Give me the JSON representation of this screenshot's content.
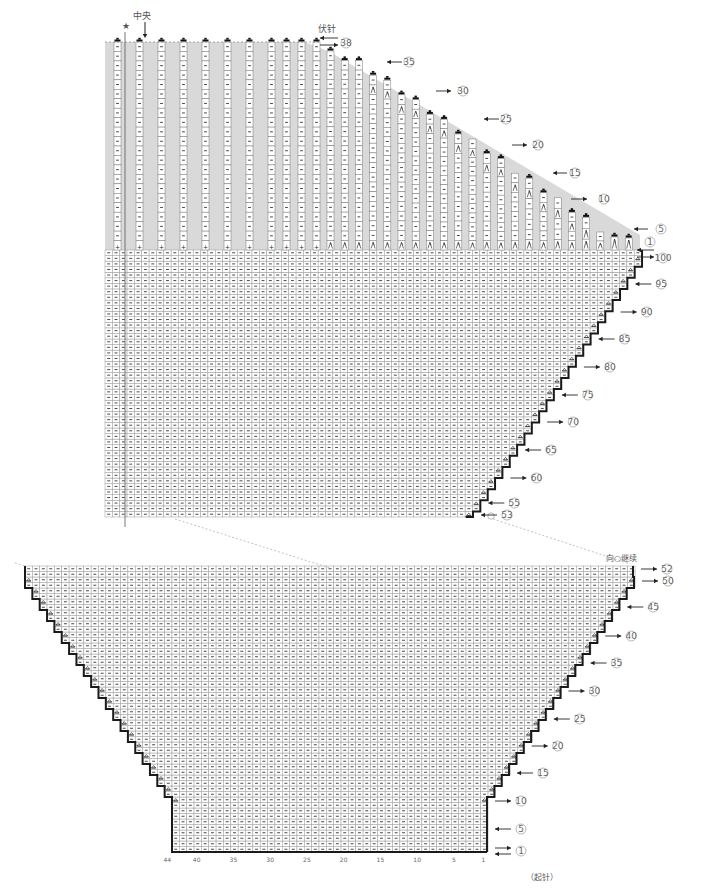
{
  "title_labels": {
    "center": "中央",
    "star": "★",
    "bind_off": "伏针",
    "continue_from": "向○继续",
    "cast_on": "（起针）"
  },
  "symbols": {
    "purl": "−",
    "decrease": "⋌",
    "increase": "⩓",
    "bind_off": "▬",
    "circle_marker": "○"
  },
  "colors": {
    "shade": "#d9d9d9",
    "grid": "#9a9a9a",
    "outline": "#1a1a1a",
    "text": "#555555"
  },
  "upper_chart": {
    "row_markers": [
      {
        "label": "①",
        "direction": "left"
      },
      {
        "label": "⑤",
        "direction": "left"
      },
      {
        "label": "⑩",
        "direction": "right"
      },
      {
        "label": "⑮",
        "direction": "left"
      },
      {
        "label": "⑳",
        "direction": "right"
      },
      {
        "label": "㉕",
        "direction": "left"
      },
      {
        "label": "㉚",
        "direction": "right"
      },
      {
        "label": "㉟",
        "direction": "left"
      },
      {
        "label": "㊳",
        "direction": "right"
      }
    ],
    "lower_row_markers": [
      {
        "label": "⑩⓪",
        "text": "100",
        "direction": "right"
      },
      {
        "label": "95",
        "direction": "left"
      },
      {
        "label": "90",
        "direction": "right"
      },
      {
        "label": "85",
        "direction": "left"
      },
      {
        "label": "80",
        "direction": "right"
      },
      {
        "label": "75",
        "direction": "left"
      },
      {
        "label": "70",
        "direction": "right"
      },
      {
        "label": "65",
        "direction": "left"
      },
      {
        "label": "60",
        "direction": "right"
      },
      {
        "label": "55",
        "direction": "left"
      },
      {
        "label": "53",
        "direction": "left"
      }
    ]
  },
  "lower_chart": {
    "row_markers": [
      {
        "label": "52",
        "direction": "right"
      },
      {
        "label": "50",
        "direction": "right"
      },
      {
        "label": "45",
        "direction": "left"
      },
      {
        "label": "40",
        "direction": "right"
      },
      {
        "label": "35",
        "direction": "left"
      },
      {
        "label": "30",
        "direction": "right"
      },
      {
        "label": "25",
        "direction": "left"
      },
      {
        "label": "20",
        "direction": "right"
      },
      {
        "label": "15",
        "direction": "left"
      },
      {
        "label": "10",
        "direction": "right"
      },
      {
        "label": "5",
        "direction": "left"
      },
      {
        "label": "1",
        "direction": "both"
      }
    ],
    "column_ticks": [
      "44",
      "40",
      "35",
      "30",
      "25",
      "20",
      "15",
      "10",
      "5",
      "1"
    ]
  }
}
